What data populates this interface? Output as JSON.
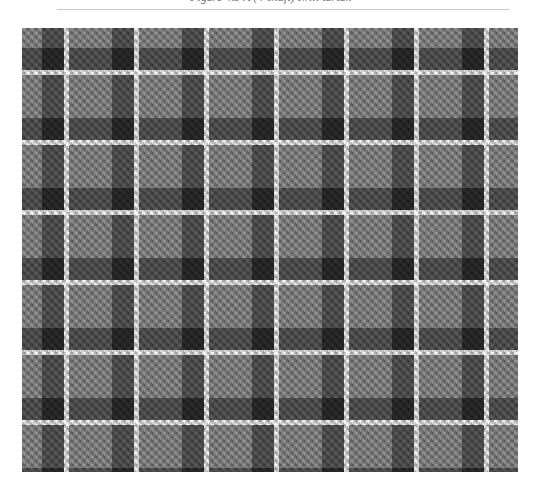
{
  "document": {
    "background_color": "#ffffff",
    "caption": {
      "text": "Figure 4.3  A (4-shaft) twill tartan",
      "visible": "partially-cropped-top-edge",
      "color": "#6e6e6e"
    },
    "rule": {
      "color": "#c9c9c9",
      "width_px": 452
    }
  },
  "figure": {
    "name": "tartan-plaid-swatch",
    "alt": "Grayscale tartan / plaid woven textile swatch with 2/2 twill diagonal texture",
    "x": 22,
    "y": 28,
    "width": 496,
    "height": 444
  },
  "chart_data": {
    "type": "heatmap",
    "xlabel": "warp threads",
    "ylabel": "weft threads",
    "grid": false,
    "legend_position": "none",
    "repeat_px": 70,
    "twill": {
      "type": "2/2 right-hand twill",
      "step_px": 2,
      "thread_px": 2,
      "angle_deg": 45,
      "contrast": 0.22
    },
    "palette": {
      "medium_gray": "#787878",
      "dark_gray": "#4a4a4a",
      "near_black": "#262626",
      "light_gray": "#c8c8c8",
      "white_stripe": "#e2e2e2",
      "page_white": "#ffffff",
      "caption_gray": "#6e6e6e",
      "rule_gray": "#c9c9c9"
    },
    "sett": {
      "note": "one repeat = 70 px; identical in warp and weft (symmetric sett)",
      "bands": [
        {
          "label": "medium",
          "color_key": "medium_gray",
          "start": 0,
          "width": 20
        },
        {
          "label": "dark",
          "color_key": "dark_gray",
          "start": 20,
          "width": 22
        },
        {
          "label": "light",
          "color_key": "light_gray",
          "start": 42,
          "width": 5
        },
        {
          "label": "medium",
          "color_key": "medium_gray",
          "start": 47,
          "width": 23
        }
      ]
    },
    "crossing_rules": [
      {
        "warp": "dark",
        "weft": "dark",
        "result": "near_black"
      },
      {
        "warp": "dark",
        "weft": "medium",
        "result": "dark_gray"
      },
      {
        "warp": "medium",
        "weft": "dark",
        "result": "dark_gray"
      },
      {
        "warp": "medium",
        "weft": "medium",
        "result": "medium_gray"
      },
      {
        "warp": "light",
        "weft": "light",
        "result": "white_stripe"
      },
      {
        "warp": "light",
        "weft": "medium",
        "result": "light_gray"
      },
      {
        "warp": "light",
        "weft": "dark",
        "result": "light_gray"
      }
    ],
    "categories": [
      "medium",
      "dark",
      "light",
      "medium"
    ],
    "values": [
      20,
      22,
      5,
      23
    ]
  }
}
